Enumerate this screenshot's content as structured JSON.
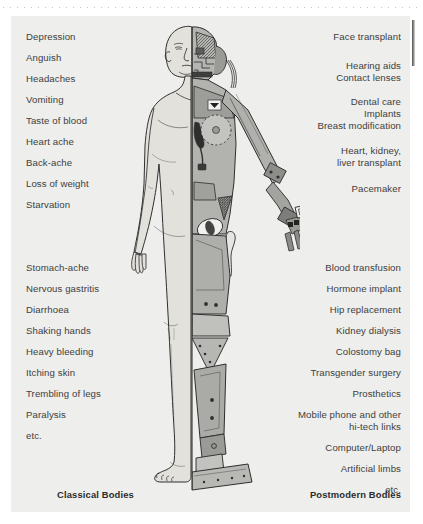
{
  "page": {
    "background_color": "#eeeeec",
    "text_color": "#3a3a3a"
  },
  "left_column": {
    "caption": "Classical Bodies",
    "group_1": [
      "Depression",
      "Anguish",
      "Headaches",
      "Vomiting",
      "Taste of blood",
      "Heart ache",
      "Back-ache",
      "Loss of weight",
      "Starvation"
    ],
    "group_2": [
      "Stomach-ache",
      "Nervous gastritis",
      "Diarrhoea",
      "Shaking hands",
      "Heavy bleeding",
      "Itching skin",
      "Trembling of legs",
      "Paralysis",
      "etc."
    ]
  },
  "right_column": {
    "caption": "Postmodern Bodies",
    "group_1": [
      "Face transplant"
    ],
    "group_2": [
      "Hearing aids",
      "Contact lenses"
    ],
    "group_3": [
      "Dental care",
      "Implants",
      "Breast modification"
    ],
    "group_4": [
      "Heart, kidney,",
      "liver transplant"
    ],
    "group_5": [
      "Pacemaker"
    ],
    "group_6": [
      "Blood transfusion",
      "Hormone implant",
      "Hip replacement",
      "Kidney dialysis",
      "Colostomy bag",
      "Transgender surgery",
      "Prosthetics"
    ],
    "group_7": [
      "Mobile phone and other",
      "hi-tech links"
    ],
    "group_8": [
      "Computer/Laptop",
      "Artificial limbs",
      "etc."
    ]
  },
  "figure": {
    "skin_color": "#e3e1dc",
    "outline_color": "#2f2f2f",
    "machine_light": "#b5b5b2",
    "machine_mid": "#8e8e8b",
    "machine_dark": "#4a4a48"
  }
}
